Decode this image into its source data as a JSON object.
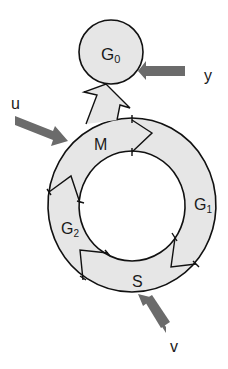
{
  "diagram": {
    "colors": {
      "fill": "#e6e6e6",
      "stroke": "#111111",
      "arrow": "#6b6b6b",
      "background": "#ffffff"
    },
    "nodes": {
      "g0": {
        "label": "G",
        "sub": "0"
      },
      "m": {
        "label": "M"
      },
      "g1": {
        "label": "G",
        "sub": "1"
      },
      "g2": {
        "label": "G",
        "sub": "2"
      },
      "s": {
        "label": "S"
      }
    },
    "inputs": {
      "u": {
        "label": "u"
      },
      "y": {
        "label": "y"
      },
      "v": {
        "label": "v"
      }
    }
  }
}
